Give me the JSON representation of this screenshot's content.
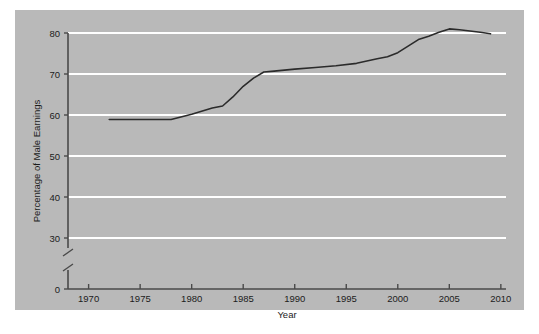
{
  "figure": {
    "background_color": "#ffffff",
    "panel_color": "#b9b9b9",
    "gridline_color": "#ffffff",
    "line_color": "#2b2b2b",
    "axis_color": "#4a4a4a",
    "text_color": "#1c1c1c"
  },
  "chart_data": {
    "type": "line",
    "title": "",
    "subtitle": "",
    "xlabel": "Year",
    "ylabel": "Percentage of Male Earnings",
    "xlim": [
      1968,
      2010.5
    ],
    "ylim": [
      0,
      84
    ],
    "y_axis_break": true,
    "y_break_range": [
      0,
      28
    ],
    "grid": true,
    "grid_axis": "y",
    "legend": false,
    "legend_position": "none",
    "xticks": [
      1970,
      1975,
      1980,
      1985,
      1990,
      1995,
      2000,
      2005,
      2010
    ],
    "xtick_labels": [
      "1970",
      "1975",
      "1980",
      "1985",
      "1990",
      "1995",
      "2000",
      "2005",
      "2010"
    ],
    "yticks": [
      0,
      30,
      40,
      50,
      60,
      70,
      80
    ],
    "ytick_labels": [
      "0",
      "30",
      "40",
      "50",
      "60",
      "70",
      "80"
    ],
    "gridline_values": [
      30,
      40,
      50,
      60,
      70,
      80
    ],
    "series": [
      {
        "name": "Female earnings as percentage of male earnings",
        "color": "#2b2b2b",
        "x": [
          1972,
          1974,
          1976,
          1978,
          1980,
          1982,
          1983,
          1984,
          1985,
          1986,
          1987,
          1988,
          1990,
          1992,
          1994,
          1996,
          1998,
          1999,
          2000,
          2001,
          2002,
          2003,
          2004,
          2005,
          2006,
          2007,
          2008,
          2009
        ],
        "y": [
          58.9,
          58.9,
          58.9,
          58.9,
          60.2,
          61.7,
          62.2,
          64.4,
          67.0,
          69.0,
          70.5,
          70.7,
          71.2,
          71.6,
          72.0,
          72.6,
          73.7,
          74.2,
          75.2,
          76.8,
          78.4,
          79.2,
          80.2,
          81.0,
          80.8,
          80.5,
          80.2,
          79.8
        ],
        "marker": "none",
        "linewidth": 1.6
      }
    ]
  }
}
